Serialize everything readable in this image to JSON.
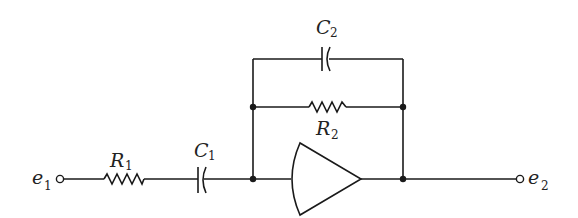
{
  "diagram": {
    "type": "circuit-schematic",
    "labels": {
      "input_terminal": {
        "main": "e",
        "sub": "1"
      },
      "output_terminal": {
        "main": "e",
        "sub": "2"
      },
      "r1": {
        "main": "R",
        "sub": "1"
      },
      "c1": {
        "main": "C",
        "sub": "1"
      },
      "r2": {
        "main": "R",
        "sub": "2"
      },
      "c2": {
        "main": "C",
        "sub": "2"
      }
    },
    "components": [
      {
        "id": "R1",
        "kind": "resistor",
        "placement": "series input"
      },
      {
        "id": "C1",
        "kind": "capacitor",
        "placement": "series input"
      },
      {
        "id": "amp",
        "kind": "amplifier",
        "placement": "main path"
      },
      {
        "id": "R2",
        "kind": "resistor",
        "placement": "feedback"
      },
      {
        "id": "C2",
        "kind": "capacitor",
        "placement": "feedback"
      }
    ],
    "colors": {
      "line": "#1a1a1a",
      "background": "#ffffff"
    }
  }
}
